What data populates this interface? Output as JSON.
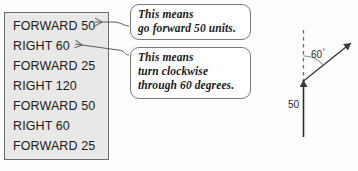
{
  "command_list": {
    "title": "logo-command-list",
    "commands": [
      "FORWARD 50",
      "RIGHT 60",
      "FORWARD 25",
      "RIGHT 120",
      "FORWARD 50",
      "RIGHT 60",
      "FORWARD 25"
    ]
  },
  "callouts": {
    "forward": {
      "lines": [
        "This means",
        "go forward 50 units."
      ],
      "target_command": "FORWARD 50"
    },
    "right": {
      "lines": [
        "This means",
        "turn clockwise",
        "through 60 degrees."
      ],
      "target_command": "RIGHT 60"
    }
  },
  "diagram": {
    "angle_label": "60",
    "angle_unit": "°",
    "distance_label": "50"
  },
  "colors": {
    "box_fill": "#e8e8e6",
    "box_border": "#6d6d6d",
    "callout_border": "#7a7a7a",
    "callout_fill": "#ffffff",
    "text": "#1b1b1b",
    "diagram_stroke": "#3a3a3a",
    "page_background": "#fdfdfd"
  }
}
